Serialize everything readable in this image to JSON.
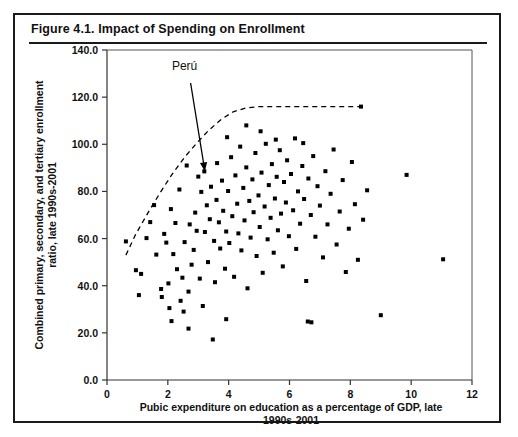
{
  "figure": {
    "title": "Figure 4.1.  Impact of Spending on Enrollment"
  },
  "chart_data": {
    "type": "scatter",
    "title": "Figure 4.1.  Impact of Spending on Enrollment",
    "xlabel": "Pubic expenditure on education as a percentage of GDP, late 1990s-2001",
    "xlabel_line1": "Pubic expenditure on education as a percentage of GDP, late",
    "xlabel_line2": "1990s-2001",
    "ylabel": "Combined primary, secondary, and tertiary enrollment ratio, late 1990s-2001",
    "ylabel_line1": "Combined primary, secondary, and tertiary enrollment",
    "ylabel_line2": "ratio, late 1990s-2001",
    "xlim": [
      0,
      12
    ],
    "ylim": [
      0,
      140
    ],
    "xticks": [
      0,
      2,
      4,
      6,
      8,
      10,
      12
    ],
    "xtick_labels": [
      "0",
      "2",
      "4",
      "6",
      "8",
      "10",
      "12"
    ],
    "yticks": [
      0,
      20,
      40,
      60,
      80,
      100,
      120,
      140
    ],
    "ytick_labels": [
      "0.0",
      "20.0",
      "40.0",
      "60.0",
      "80.0",
      "100.0",
      "120.0",
      "140.0"
    ],
    "grid": false,
    "legend": false,
    "marker_color": "#000000",
    "marker_shape": "square",
    "annotations": [
      {
        "text": "Perú",
        "label_x": 2.55,
        "label_y": 131.5,
        "arrow_from_x": 2.75,
        "arrow_from_y": 126.0,
        "arrow_to_x": 3.22,
        "arrow_to_y": 88.5
      }
    ],
    "trend_curve": {
      "style": "dashed",
      "description": "Upper envelope frontier rising then plateauing near 116",
      "points": [
        [
          0.62,
          53.0
        ],
        [
          0.95,
          62.0
        ],
        [
          1.35,
          71.0
        ],
        [
          1.75,
          79.5
        ],
        [
          2.15,
          87.5
        ],
        [
          2.55,
          94.5
        ],
        [
          2.95,
          100.5
        ],
        [
          3.35,
          106.0
        ],
        [
          3.75,
          110.5
        ],
        [
          4.15,
          113.8
        ],
        [
          4.55,
          115.4
        ],
        [
          5.0,
          116.0
        ],
        [
          5.6,
          116.0
        ],
        [
          6.3,
          116.0
        ],
        [
          7.0,
          116.0
        ],
        [
          7.7,
          116.0
        ],
        [
          8.45,
          116.0
        ]
      ]
    },
    "points": [
      [
        0.62,
        58.8
      ],
      [
        0.95,
        46.6
      ],
      [
        1.12,
        45.0
      ],
      [
        1.3,
        60.2
      ],
      [
        1.55,
        74.2
      ],
      [
        1.62,
        53.2
      ],
      [
        1.78,
        38.6
      ],
      [
        1.8,
        35.2
      ],
      [
        1.88,
        62.0
      ],
      [
        1.95,
        58.3
      ],
      [
        2.02,
        41.0
      ],
      [
        2.1,
        72.5
      ],
      [
        2.18,
        53.4
      ],
      [
        2.25,
        66.6
      ],
      [
        2.3,
        47.0
      ],
      [
        2.38,
        80.8
      ],
      [
        2.42,
        33.6
      ],
      [
        2.48,
        43.4
      ],
      [
        2.55,
        58.5
      ],
      [
        2.62,
        91.0
      ],
      [
        2.68,
        37.5
      ],
      [
        2.72,
        66.0
      ],
      [
        2.78,
        48.9
      ],
      [
        2.85,
        55.2
      ],
      [
        2.9,
        71.0
      ],
      [
        2.95,
        63.3
      ],
      [
        3.0,
        86.3
      ],
      [
        3.05,
        43.0
      ],
      [
        3.1,
        79.8
      ],
      [
        3.15,
        31.4
      ],
      [
        3.2,
        88.5
      ],
      [
        3.22,
        62.8
      ],
      [
        3.28,
        74.1
      ],
      [
        3.32,
        50.0
      ],
      [
        3.38,
        68.2
      ],
      [
        3.42,
        82.0
      ],
      [
        3.48,
        17.2
      ],
      [
        3.52,
        59.0
      ],
      [
        3.55,
        41.5
      ],
      [
        3.6,
        76.4
      ],
      [
        3.62,
        92.0
      ],
      [
        3.68,
        66.9
      ],
      [
        3.72,
        55.8
      ],
      [
        3.78,
        84.6
      ],
      [
        3.82,
        71.8
      ],
      [
        3.88,
        47.2
      ],
      [
        3.92,
        63.0
      ],
      [
        3.98,
        80.2
      ],
      [
        4.02,
        58.1
      ],
      [
        4.08,
        94.5
      ],
      [
        4.12,
        69.5
      ],
      [
        4.18,
        43.8
      ],
      [
        4.22,
        86.8
      ],
      [
        4.28,
        74.8
      ],
      [
        4.32,
        62.2
      ],
      [
        4.38,
        99.0
      ],
      [
        4.42,
        55.0
      ],
      [
        4.48,
        81.5
      ],
      [
        4.52,
        67.7
      ],
      [
        4.58,
        90.2
      ],
      [
        4.62,
        38.9
      ],
      [
        4.68,
        76.0
      ],
      [
        4.72,
        60.4
      ],
      [
        4.78,
        85.1
      ],
      [
        4.82,
        71.2
      ],
      [
        4.88,
        96.3
      ],
      [
        4.92,
        52.6
      ],
      [
        4.98,
        78.3
      ],
      [
        5.02,
        64.9
      ],
      [
        5.08,
        88.0
      ],
      [
        5.12,
        45.5
      ],
      [
        5.18,
        73.6
      ],
      [
        5.22,
        100.2
      ],
      [
        5.28,
        59.7
      ],
      [
        5.32,
        82.7
      ],
      [
        5.38,
        68.8
      ],
      [
        5.42,
        91.6
      ],
      [
        5.48,
        54.0
      ],
      [
        5.52,
        77.0
      ],
      [
        5.58,
        86.2
      ],
      [
        5.62,
        63.5
      ],
      [
        5.68,
        97.5
      ],
      [
        5.72,
        70.6
      ],
      [
        5.78,
        48.2
      ],
      [
        5.82,
        84.0
      ],
      [
        5.88,
        75.3
      ],
      [
        5.92,
        93.2
      ],
      [
        5.98,
        61.0
      ],
      [
        6.05,
        87.4
      ],
      [
        6.12,
        72.0
      ],
      [
        6.18,
        102.5
      ],
      [
        6.22,
        55.6
      ],
      [
        6.28,
        80.0
      ],
      [
        6.35,
        66.3
      ],
      [
        6.42,
        90.8
      ],
      [
        6.48,
        76.8
      ],
      [
        6.55,
        42.0
      ],
      [
        6.62,
        85.5
      ],
      [
        6.7,
        70.0
      ],
      [
        6.78,
        95.0
      ],
      [
        6.85,
        60.8
      ],
      [
        6.92,
        82.2
      ],
      [
        7.0,
        74.0
      ],
      [
        7.1,
        52.0
      ],
      [
        7.18,
        88.6
      ],
      [
        7.25,
        66.0
      ],
      [
        7.35,
        79.0
      ],
      [
        7.45,
        97.8
      ],
      [
        7.55,
        57.5
      ],
      [
        7.65,
        71.5
      ],
      [
        7.75,
        84.8
      ],
      [
        7.85,
        45.8
      ],
      [
        7.95,
        64.2
      ],
      [
        8.05,
        92.5
      ],
      [
        8.15,
        74.6
      ],
      [
        8.25,
        51.0
      ],
      [
        8.35,
        116.0
      ],
      [
        8.42,
        68.0
      ],
      [
        8.55,
        80.5
      ],
      [
        9.0,
        27.5
      ],
      [
        9.85,
        87.0
      ],
      [
        11.05,
        51.2
      ],
      [
        2.12,
        25.0
      ],
      [
        2.68,
        21.8
      ],
      [
        3.92,
        25.8
      ],
      [
        6.6,
        24.8
      ],
      [
        6.72,
        24.5
      ],
      [
        4.58,
        108.0
      ],
      [
        5.05,
        105.5
      ],
      [
        3.95,
        103.0
      ],
      [
        5.55,
        102.0
      ],
      [
        6.45,
        100.5
      ],
      [
        1.42,
        67.0
      ],
      [
        1.05,
        36.0
      ],
      [
        2.05,
        30.5
      ],
      [
        2.52,
        29.0
      ]
    ]
  }
}
